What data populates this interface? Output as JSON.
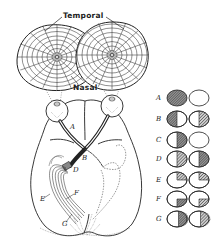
{
  "figure": {
    "labels": {
      "temporal": "Temporal",
      "nasal": "Nasal"
    },
    "pathway_labels": [
      "A",
      "B",
      "D",
      "E",
      "F",
      "G"
    ],
    "legend": {
      "rows": [
        {
          "label": "A",
          "left_eye": "full-blind",
          "right_eye": "normal"
        },
        {
          "label": "B",
          "left_eye": "temporal-half-blind",
          "right_eye": "temporal-half-blind"
        },
        {
          "label": "C",
          "left_eye": "nasal-half-blind",
          "right_eye": "normal"
        },
        {
          "label": "D",
          "left_eye": "right-half-blind",
          "right_eye": "right-half-blind"
        },
        {
          "label": "E",
          "left_eye": "upper-right-quadrant-blind",
          "right_eye": "upper-right-quadrant-blind"
        },
        {
          "label": "F",
          "left_eye": "lower-right-quadrant-blind",
          "right_eye": "lower-right-quadrant-blind"
        },
        {
          "label": "G",
          "left_eye": "right-half-blind-macular-sparing",
          "right_eye": "right-half-blind-macular-sparing"
        }
      ]
    },
    "colors": {
      "ink": "#222222",
      "hatch": "#555555",
      "background": "#ffffff"
    }
  }
}
